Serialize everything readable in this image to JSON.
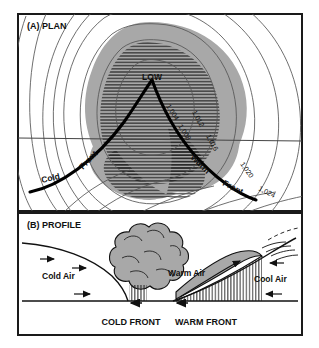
{
  "figure": {
    "panels": [
      {
        "id": "plan",
        "label": "(A) PLAN",
        "center_label": "LOW",
        "fronts": [
          {
            "name": "cold-front",
            "word1": "Cold",
            "word2": "Front"
          },
          {
            "name": "warm-front",
            "word1": "Warm",
            "word2": "Front"
          }
        ],
        "isobars": [
          "1,004",
          "1,008",
          "1,012",
          "1,016",
          "1,020",
          "1,024"
        ]
      },
      {
        "id": "profile",
        "label": "(B) PROFILE",
        "air_masses": [
          {
            "name": "cold-air",
            "label": "Cold Air"
          },
          {
            "name": "warm-air",
            "label": "Warm Air"
          },
          {
            "name": "cool-air",
            "label": "Cool Air"
          }
        ],
        "front_labels": [
          {
            "name": "cold-front",
            "label": "COLD FRONT"
          },
          {
            "name": "warm-front",
            "label": "WARM FRONT"
          }
        ]
      }
    ],
    "colors": {
      "frame": "#1a1a1a",
      "cloud_fill": "#a8a8a8",
      "isobar": "#555555",
      "front_line": "#000000",
      "background": "#ffffff"
    }
  }
}
